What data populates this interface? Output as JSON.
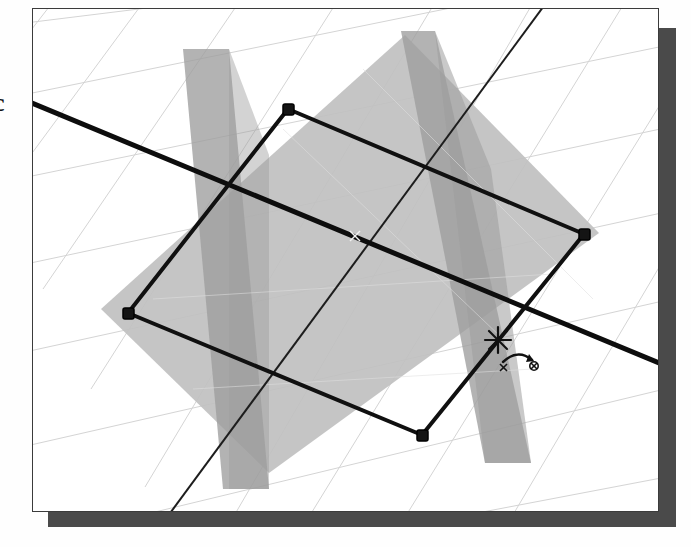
{
  "app": {
    "view_title": "3D perspective modeling viewport",
    "partial_left_glyph": "c"
  },
  "canvas": {
    "name": "viewport-canvas",
    "background_color": "#ffffff",
    "border_color": "#3b3b3b",
    "shadow_color": "#4a4a4a",
    "bounds": {
      "x": 32,
      "y": 8,
      "width": 627,
      "height": 504
    }
  },
  "grid": {
    "name": "perspective-grid",
    "color": "#d2d2d2",
    "line_width": 1,
    "family_a_count": 8,
    "family_b_count": 9,
    "description": "Two families of near-parallel construction lines in one-point perspective"
  },
  "planes": [
    {
      "name": "ground-plane",
      "fill": "#b9b9b9",
      "opacity": 0.9,
      "points": "68,310 404,36 596,234 266,474"
    },
    {
      "name": "vertical-plane-left",
      "fill": "#9a9a9a",
      "opacity": 0.85,
      "points": "178,22 194,186 232,486 211,327"
    },
    {
      "name": "vertical-plane-right",
      "fill": "#9a9a9a",
      "opacity": 0.85,
      "points": "398,20 470,210 498,460 419,250"
    }
  ],
  "shape": {
    "name": "selected-rectangle",
    "stroke": "#101010",
    "stroke_width": 4,
    "corners": [
      {
        "label": "top-node",
        "x": 287,
        "y": 108
      },
      {
        "label": "right-node",
        "x": 583,
        "y": 233
      },
      {
        "label": "bottom-node",
        "x": 421,
        "y": 434
      },
      {
        "label": "left-node",
        "x": 127,
        "y": 312
      }
    ],
    "node_marker": {
      "type": "square-handle",
      "size": 9,
      "fill": "#141414",
      "stroke": "#000000"
    }
  },
  "construction_lines": [
    {
      "name": "axis-line-horizontal",
      "x1": 36,
      "y1": 100,
      "x2": 691,
      "y2": 372,
      "stroke": "#0d0d0d",
      "stroke_width": 5
    },
    {
      "name": "axis-line-vertical",
      "x1": 548,
      "y1": 6,
      "x2": 150,
      "y2": 540,
      "stroke": "#1a1a1a",
      "stroke_width": 2
    }
  ],
  "cursor": {
    "name": "arc-tool-cursor",
    "crosshair": {
      "x": 498,
      "y": 340,
      "arm": 11,
      "color": "#111111"
    },
    "hint_icon": {
      "name": "arc-icon",
      "x": 517,
      "y": 356,
      "color": "#111111",
      "description": "small arc with endpoint markers indicating arc / rotate tool"
    }
  }
}
